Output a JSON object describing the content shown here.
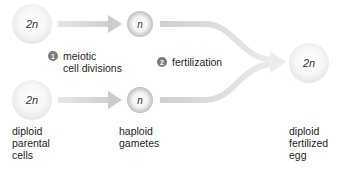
{
  "diagram": {
    "title": "",
    "cells": {
      "parent_top": {
        "ploidy": "2n"
      },
      "parent_bottom": {
        "ploidy": "2n"
      },
      "gamete_top": {
        "ploidy": "n"
      },
      "gamete_bottom": {
        "ploidy": "n"
      },
      "zygote": {
        "ploidy": "2n"
      }
    },
    "steps": [
      {
        "number": "1",
        "label": "meiotic\ncell divisions"
      },
      {
        "number": "2",
        "label": "fertilization"
      }
    ],
    "labels": {
      "parents": "diploid\nparental\ncells",
      "gametes": "haploid\ngametes",
      "zygote": "diploid\nfertilized\negg"
    },
    "colors": {
      "arrow": "#d6d6d6",
      "step_badge": "#7a7a7a",
      "text": "#1e1e1e"
    }
  }
}
